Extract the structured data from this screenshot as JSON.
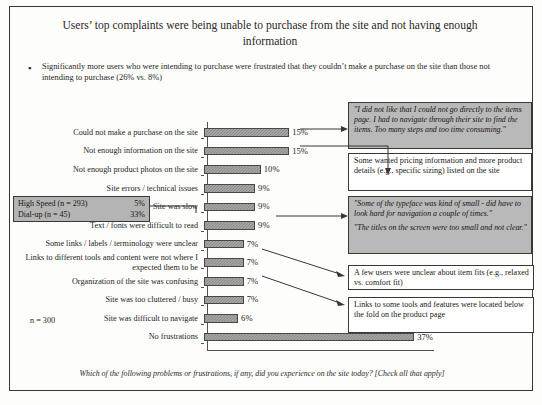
{
  "slide": {
    "title": "Users’ top complaints were being unable to purchase from the site and not having enough information",
    "bullet_mark": "▪",
    "bullet": "Significantly more users who were intending to purchase were frustrated that they couldn’t make a purchase on the site than those not intending to purchase (26% vs. 8%)",
    "n_label": "n = 300",
    "footer": "Which of the following problems or frustrations, if any, did you experience on the site today? [Check all that apply]"
  },
  "speed_callout": {
    "rows": [
      {
        "label": "High Speed (n = 293)",
        "value": "5%"
      },
      {
        "label": "Dial-up (n = 45)",
        "value": "33%"
      }
    ]
  },
  "callouts": [
    {
      "id": "co1",
      "style": "quote",
      "lines": [
        "\"I did not like that I could not go directly  to the items page. I had to navigate through their site to find the items. Too many steps and too time consuming.\""
      ]
    },
    {
      "id": "co2",
      "style": "plain",
      "lines": [
        "Some wanted pricing information and more product details (e.g., specific sizing) listed on the site"
      ]
    },
    {
      "id": "co3",
      "style": "quote",
      "lines": [
        "\"Some of the typeface was kind of small - did have to look hard for navigation a couple of times.\"",
        "\"The titles on the screen were too small and not clear.\""
      ]
    },
    {
      "id": "co4",
      "style": "plain",
      "lines": [
        "A few users were unclear about item fits (e.g., relaxed vs. comfort fit)"
      ]
    },
    {
      "id": "co5",
      "style": "plain",
      "lines": [
        "Links to some tools and features were located below the fold on the product page"
      ]
    }
  ],
  "chart_data": {
    "type": "bar",
    "orientation": "horizontal",
    "title": "Users’ top complaints were being unable to purchase from the site and not having enough information",
    "xlabel": "",
    "ylabel": "",
    "xlim": [
      0,
      48
    ],
    "grid": false,
    "legend": false,
    "bar_color": "#8b8b8b",
    "categories": [
      "Could not make a purchase on the site",
      "Not enough information on the site",
      "Not enough product photos on the site",
      "Site errors / technical issues",
      "Site was slow",
      "Text / fonts were difficult to read",
      "Some links / labels / terminology were unclear",
      "Links to different tools and content were not where I expected them to be",
      "Organization of the site was confusing",
      "Site was too cluttered / busy",
      "Site was difficult to navigate",
      "No frustrations"
    ],
    "values": [
      15,
      15,
      10,
      9,
      9,
      9,
      7,
      7,
      7,
      7,
      6,
      37
    ],
    "value_labels": [
      "15%",
      "15%",
      "10%",
      "9%",
      "9%",
      "9%",
      "7%",
      "7%",
      "7%",
      "7%",
      "6%",
      "37%"
    ]
  }
}
